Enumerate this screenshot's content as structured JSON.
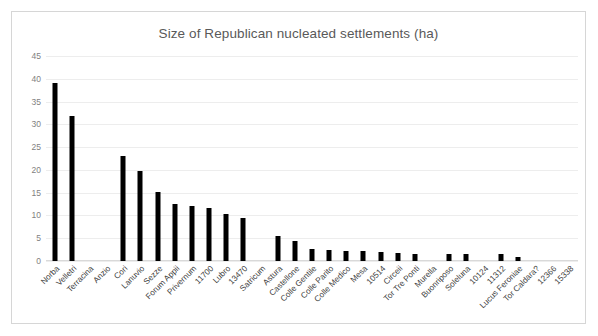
{
  "chart": {
    "title": "Size of Republican nucleated settlements (ha)",
    "frame_border_color": "#d6d6d6",
    "bar_color": "#000000",
    "gridline_color": "#ededed",
    "tick_label_color": "#7f7f7f"
  },
  "chart_data": {
    "type": "bar",
    "title": "Size of Republican nucleated settlements (ha)",
    "xlabel": "",
    "ylabel": "",
    "ylim": [
      0,
      45
    ],
    "yticks": [
      0,
      5,
      10,
      15,
      20,
      25,
      30,
      35,
      40,
      45
    ],
    "grid": true,
    "legend": "none",
    "categories": [
      "Norba",
      "Velletri",
      "Terracina",
      "Anzio",
      "Cori",
      "Lanuvio",
      "Sezze",
      "Forum Appii",
      "Privernum",
      "11700",
      "Lubro",
      "13470",
      "Satricum",
      "Astura",
      "Castellone",
      "Colle Gentile",
      "Colle Parito",
      "Colle Medico",
      "Mesa",
      "10514",
      "Circeii",
      "Tor Tre Ponti",
      "Murella",
      "Buonriposo",
      "Soleluna",
      "10124",
      "11312",
      "Lucus Feroniae",
      "Tor Caldara?",
      "12366",
      "15338"
    ],
    "values": [
      39.0,
      31.9,
      0,
      0,
      23.0,
      19.7,
      15.2,
      12.5,
      12.0,
      11.7,
      10.4,
      9.5,
      0,
      5.6,
      4.4,
      2.7,
      2.4,
      2.2,
      2.1,
      1.9,
      1.8,
      1.6,
      0,
      1.6,
      1.6,
      0,
      1.5,
      0.9,
      0,
      0,
      0
    ]
  }
}
